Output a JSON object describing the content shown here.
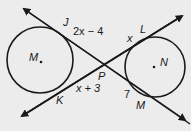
{
  "diagram": {
    "circles": [
      {
        "name": "M",
        "label": "M"
      },
      {
        "name": "N",
        "label": "N"
      }
    ],
    "points": {
      "J": "J",
      "K": "K",
      "L": "L",
      "M_tangent": "M",
      "P": "P"
    },
    "segment_labels": {
      "JP": "2x − 4",
      "KP": "x + 3",
      "LP": "x",
      "MP": "7"
    }
  },
  "colors": {
    "background": "#ececec",
    "stroke": "#1a1a1a"
  }
}
